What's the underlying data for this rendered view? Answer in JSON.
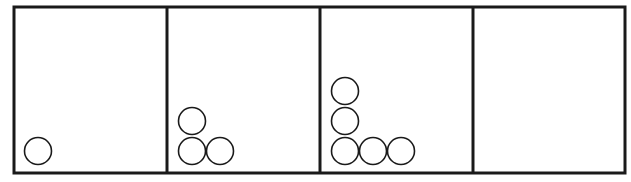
{
  "diagram": {
    "type": "pattern-sequence",
    "colors": {
      "stroke": "#1a1a1a",
      "background": "#ffffff"
    },
    "frame": {
      "x": 14,
      "y": 7,
      "width": 611,
      "height": 166,
      "stroke_width": 3
    },
    "dividers_x": [
      167,
      320,
      473
    ],
    "circle_radius": 13.5,
    "panels": [
      {
        "index": 1,
        "circle_count": 1,
        "circles": [
          {
            "cx": 38,
            "cy": 151
          }
        ]
      },
      {
        "index": 2,
        "circle_count": 3,
        "circles": [
          {
            "cx": 192,
            "cy": 121
          },
          {
            "cx": 192,
            "cy": 151
          },
          {
            "cx": 220,
            "cy": 151
          }
        ]
      },
      {
        "index": 3,
        "circle_count": 6,
        "circles": [
          {
            "cx": 345,
            "cy": 91
          },
          {
            "cx": 345,
            "cy": 121
          },
          {
            "cx": 345,
            "cy": 151
          },
          {
            "cx": 373,
            "cy": 151
          },
          {
            "cx": 401,
            "cy": 151
          }
        ]
      },
      {
        "index": 4,
        "circle_count": 0,
        "circles": []
      }
    ]
  }
}
